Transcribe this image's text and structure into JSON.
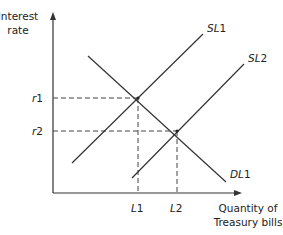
{
  "diagram": {
    "type": "supply-demand",
    "y_axis_label_line1": "Interest",
    "y_axis_label_line2": "rate",
    "x_axis_label_line1": "Quantity of",
    "x_axis_label_line2": "Treasury bills",
    "curves": [
      {
        "id": "SL1",
        "label_main": "SL",
        "label_num": "1",
        "kind": "supply"
      },
      {
        "id": "SL2",
        "label_main": "SL",
        "label_num": "2",
        "kind": "supply"
      },
      {
        "id": "DL1",
        "label_main": "DL",
        "label_num": "1",
        "kind": "demand"
      }
    ],
    "y_ticks": [
      {
        "label_main": "r",
        "label_num": "1"
      },
      {
        "label_main": "r",
        "label_num": "2"
      }
    ],
    "x_ticks": [
      {
        "label_main": "L",
        "label_num": "1"
      },
      {
        "label_main": "L",
        "label_num": "2"
      }
    ],
    "equilibria": [
      {
        "curves": [
          "SL1",
          "DL1"
        ],
        "rate": "r1",
        "quantity": "L1"
      },
      {
        "curves": [
          "SL2",
          "DL1"
        ],
        "rate": "r2",
        "quantity": "L2"
      }
    ],
    "colors": {
      "line": "#333333",
      "text": "#222222",
      "background": "#ffffff"
    }
  }
}
